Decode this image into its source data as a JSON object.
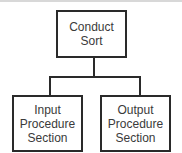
{
  "diagram": {
    "type": "hierarchy-chart",
    "root": {
      "label": "Conduct\nSort"
    },
    "children": [
      {
        "label": "Input\nProcedure\nSection"
      },
      {
        "label": "Output\nProcedure\nSection"
      }
    ],
    "colors": {
      "stroke": "#2a2a2a",
      "text": "#3a3a3a",
      "background": "#ffffff"
    }
  }
}
